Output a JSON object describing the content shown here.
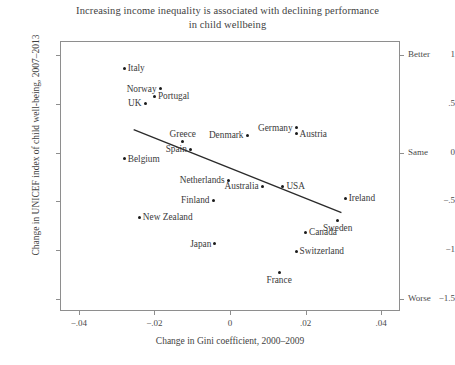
{
  "chart_data": {
    "type": "scatter",
    "title": "Increasing income inequality is associated with declining performance in child wellbeing",
    "title_line1": "Increasing income inequality is associated with declining performance",
    "title_line2": "in child wellbeing",
    "xlabel": "Change in Gini coefficient, 2000–2009",
    "ylabel": "Change in UNICEF index of child well-being, 2007–2013",
    "xlim": [
      -0.045,
      0.045
    ],
    "ylim": [
      -1.62,
      1.14
    ],
    "grid": false,
    "legend": "none",
    "xticks": [
      -0.04,
      -0.02,
      0,
      0.02,
      0.04
    ],
    "xticklabels": [
      "−.04",
      "−.02",
      "0",
      ".02",
      ".04"
    ],
    "yticks": [
      1,
      0.5,
      0,
      -0.5,
      -1,
      -1.5
    ],
    "yticklabels": [
      "1",
      ".5",
      "0",
      "−.5",
      "−1",
      "−1.5"
    ],
    "right_axis_ticks": [
      1,
      0,
      -1.5
    ],
    "right_axis_labels": [
      "Better",
      "Same",
      "Worse"
    ],
    "marker_color": "#1a1a1a",
    "line_color": "#2b2b2b",
    "fit_line": {
      "x0": -0.0255,
      "y0": 0.235,
      "x1": 0.0295,
      "y1": -0.615
    },
    "points": [
      {
        "label": "Italy",
        "x": -0.028,
        "y": 0.86,
        "label_pos": "right"
      },
      {
        "label": "Norway",
        "x": -0.0185,
        "y": 0.65,
        "label_pos": "left"
      },
      {
        "label": "Portugal",
        "x": -0.02,
        "y": 0.575,
        "label_pos": "right"
      },
      {
        "label": "UK",
        "x": -0.0225,
        "y": 0.505,
        "label_pos": "left"
      },
      {
        "label": "Germany",
        "x": 0.0175,
        "y": 0.255,
        "label_pos": "left"
      },
      {
        "label": "Austria",
        "x": 0.0175,
        "y": 0.19,
        "label_pos": "right"
      },
      {
        "label": "Denmark",
        "x": 0.0045,
        "y": 0.175,
        "label_pos": "left"
      },
      {
        "label": "Greece",
        "x": -0.0125,
        "y": 0.11,
        "label_pos": "above"
      },
      {
        "label": "Spain",
        "x": -0.0105,
        "y": 0.035,
        "label_pos": "left"
      },
      {
        "label": "Belgium",
        "x": -0.028,
        "y": -0.065,
        "label_pos": "right"
      },
      {
        "label": "Netherlands",
        "x": -0.0005,
        "y": -0.285,
        "label_pos": "left"
      },
      {
        "label": "Australia",
        "x": 0.0085,
        "y": -0.345,
        "label_pos": "left"
      },
      {
        "label": "USA",
        "x": 0.014,
        "y": -0.345,
        "label_pos": "right"
      },
      {
        "label": "Ireland",
        "x": 0.0305,
        "y": -0.465,
        "label_pos": "right"
      },
      {
        "label": "Finland",
        "x": -0.0045,
        "y": -0.49,
        "label_pos": "left"
      },
      {
        "label": "New Zealand",
        "x": -0.024,
        "y": -0.66,
        "label_pos": "right"
      },
      {
        "label": "Sweden",
        "x": 0.0285,
        "y": -0.69,
        "label_pos": "below"
      },
      {
        "label": "Canada",
        "x": 0.02,
        "y": -0.815,
        "label_pos": "right"
      },
      {
        "label": "Japan",
        "x": -0.004,
        "y": -0.935,
        "label_pos": "left"
      },
      {
        "label": "Switzerland",
        "x": 0.0175,
        "y": -1.01,
        "label_pos": "right"
      },
      {
        "label": "France",
        "x": 0.013,
        "y": -1.225,
        "label_pos": "below"
      }
    ]
  }
}
